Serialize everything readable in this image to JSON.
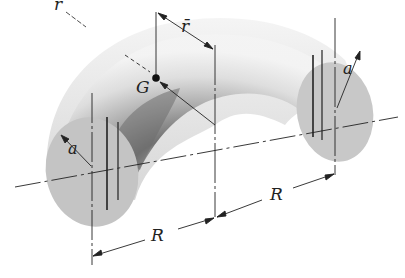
{
  "figure": {
    "labels": {
      "r": "r",
      "r_bar": "r̄",
      "G": "G",
      "a_left": "a",
      "a_right": "a",
      "R_left": "R",
      "R_right": "R"
    },
    "colors": {
      "ink": "#222222",
      "shade_dark": "#6a6a6a",
      "shade_mid": "#a8a8a8",
      "shade_light": "#e2e2e2",
      "section_fill": "#bdbdbd"
    }
  }
}
